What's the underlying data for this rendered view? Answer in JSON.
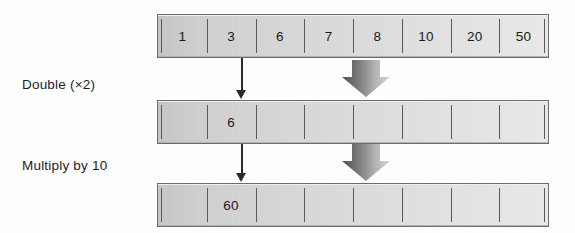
{
  "diagram": {
    "steps": [
      {
        "label": "Double (×2)"
      },
      {
        "label": "Multiply by 10"
      }
    ],
    "rows": [
      {
        "name": "original-array",
        "cells": [
          "1",
          "3",
          "6",
          "7",
          "8",
          "10",
          "20",
          "50"
        ]
      },
      {
        "name": "doubled-array",
        "cells": [
          "",
          "6",
          "",
          "",
          "",
          "",
          "",
          ""
        ]
      },
      {
        "name": "multiplied-array",
        "cells": [
          "",
          "60",
          "",
          "",
          "",
          "",
          "",
          ""
        ]
      }
    ],
    "connectors": [
      {
        "name": "value-flow-arrow-1",
        "icon": "down-arrow-icon"
      },
      {
        "name": "value-flow-arrow-2",
        "icon": "down-arrow-icon"
      }
    ],
    "transitions": [
      {
        "name": "step-arrow-1",
        "icon": "block-down-arrow-icon"
      },
      {
        "name": "step-arrow-2",
        "icon": "block-down-arrow-icon"
      }
    ],
    "colors": {
      "cell_fill_left": "#c6c6c6",
      "cell_fill_right": "#e9e9e9",
      "border": "#6d6d6d",
      "divider": "#5a5a5a",
      "text": "#1a1a1a",
      "arrow_dark": "#4a4a4a",
      "arrow_light": "#d2d2d2",
      "background": "#ffffff"
    }
  }
}
